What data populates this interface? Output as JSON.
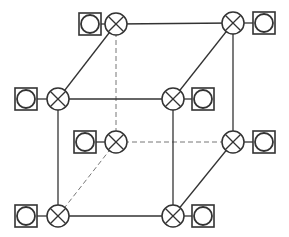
{
  "diagram": {
    "stroke_color": "#333333",
    "background": "#ffffff",
    "node_radius": 11,
    "terminal_size": 22,
    "terminal_circle_radius": 9,
    "nodes": [
      {
        "id": "back-top-left",
        "x": 116,
        "y": 24,
        "terminal": {
          "x": 90,
          "y": 24,
          "side": "left"
        }
      },
      {
        "id": "back-top-right",
        "x": 233,
        "y": 23,
        "terminal": {
          "x": 264,
          "y": 23,
          "side": "right"
        }
      },
      {
        "id": "front-top-left",
        "x": 58,
        "y": 99,
        "terminal": {
          "x": 26,
          "y": 99,
          "side": "left"
        }
      },
      {
        "id": "front-top-right",
        "x": 173,
        "y": 99,
        "terminal": {
          "x": 203,
          "y": 99,
          "side": "right"
        }
      },
      {
        "id": "back-bottom-left",
        "x": 116,
        "y": 142,
        "terminal": {
          "x": 85,
          "y": 142,
          "side": "left"
        }
      },
      {
        "id": "back-bottom-right",
        "x": 233,
        "y": 142,
        "terminal": {
          "x": 264,
          "y": 142,
          "side": "right"
        }
      },
      {
        "id": "front-bottom-left",
        "x": 58,
        "y": 216,
        "terminal": {
          "x": 26,
          "y": 216,
          "side": "left"
        }
      },
      {
        "id": "front-bottom-right",
        "x": 173,
        "y": 216,
        "terminal": {
          "x": 203,
          "y": 216,
          "side": "right"
        }
      }
    ],
    "edges": [
      {
        "from": "back-top-left",
        "to": "back-top-right",
        "style": "solid"
      },
      {
        "from": "back-top-right",
        "to": "back-bottom-right",
        "style": "solid"
      },
      {
        "from": "back-top-left",
        "to": "back-bottom-left",
        "style": "dashed"
      },
      {
        "from": "back-bottom-left",
        "to": "back-bottom-right",
        "style": "dashed"
      },
      {
        "from": "front-top-left",
        "to": "front-top-right",
        "style": "solid"
      },
      {
        "from": "front-top-left",
        "to": "front-bottom-left",
        "style": "solid"
      },
      {
        "from": "front-top-right",
        "to": "front-bottom-right",
        "style": "solid"
      },
      {
        "from": "front-bottom-left",
        "to": "front-bottom-right",
        "style": "solid"
      },
      {
        "from": "back-top-left",
        "to": "front-top-left",
        "style": "solid"
      },
      {
        "from": "back-top-right",
        "to": "front-top-right",
        "style": "solid"
      },
      {
        "from": "back-bottom-right",
        "to": "front-bottom-right",
        "style": "solid"
      },
      {
        "from": "back-bottom-left",
        "to": "front-bottom-left",
        "style": "dashed"
      }
    ]
  }
}
